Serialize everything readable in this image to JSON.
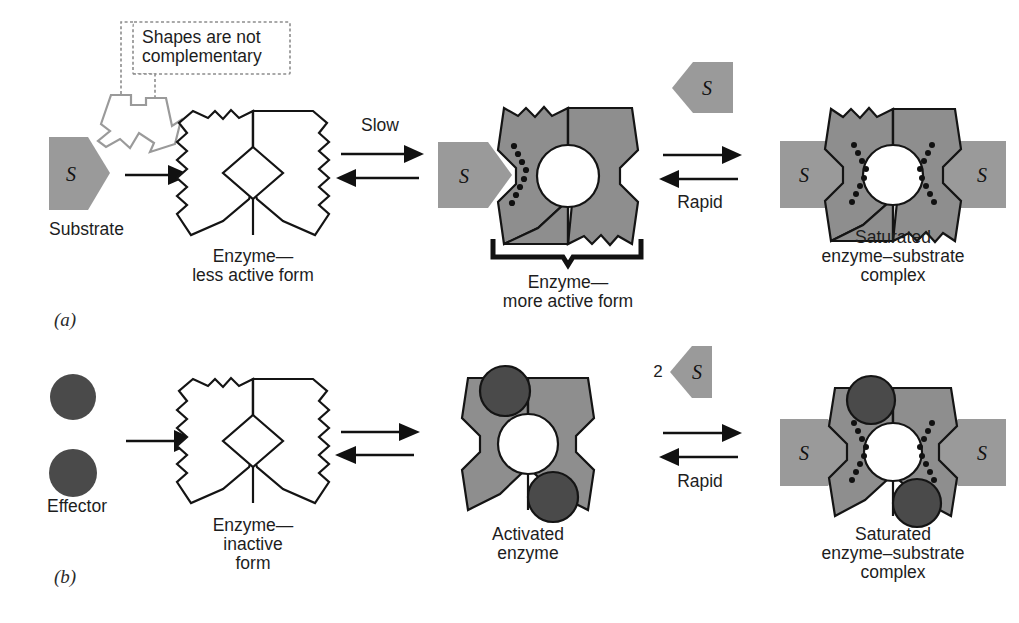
{
  "figure": {
    "background_color": "#ffffff",
    "colors": {
      "substrate_gray": "#9a9a9a",
      "enzyme_gray": "#8e8e8e",
      "effector_dark": "#4a4a4a",
      "outline_black": "#141414",
      "callout_gray": "#9a9a9a"
    }
  },
  "panel_a": {
    "label": "(a)",
    "substrate": {
      "symbol": "S",
      "caption": "Substrate"
    },
    "callout": {
      "line1": "Shapes are not",
      "line2": "complementary"
    },
    "forward_arrow": {
      "name": "binding-arrow"
    },
    "enzyme_inactive": {
      "caption_line1": "Enzyme—",
      "caption_line2": "less active form"
    },
    "equilibrium_1": {
      "label": "Slow",
      "label_position": "above"
    },
    "enzyme_active": {
      "caption_line1": "Enzyme—",
      "caption_line2": "more active form",
      "bound_substrate_symbol": "S"
    },
    "free_substrate": {
      "symbol": "S"
    },
    "equilibrium_2": {
      "label": "Rapid",
      "label_position": "below"
    },
    "complex": {
      "caption_line1": "Saturated",
      "caption_line2": "enzyme–substrate",
      "caption_line3": "complex",
      "left_substrate_symbol": "S",
      "right_substrate_symbol": "S"
    }
  },
  "panel_b": {
    "label": "(b)",
    "effector": {
      "caption": "Effector",
      "count": 2
    },
    "forward_arrow": {
      "name": "binding-arrow"
    },
    "enzyme_inactive": {
      "caption_line1": "Enzyme—",
      "caption_line2": "inactive",
      "caption_line3": "form"
    },
    "equilibrium_1": {
      "label": "",
      "label_position": "none"
    },
    "enzyme_activated": {
      "caption_line1": "Activated",
      "caption_line2": "enzyme"
    },
    "free_substrate": {
      "count_label": "2",
      "symbol": "S"
    },
    "equilibrium_2": {
      "label": "Rapid",
      "label_position": "below"
    },
    "complex": {
      "caption_line1": "Saturated",
      "caption_line2": "enzyme–substrate",
      "caption_line3": "complex",
      "left_substrate_symbol": "S",
      "right_substrate_symbol": "S"
    }
  }
}
